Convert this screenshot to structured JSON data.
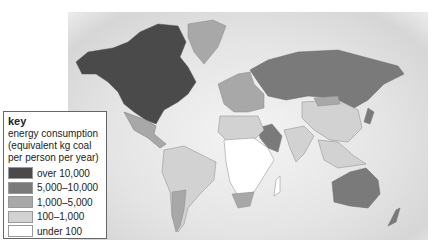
{
  "map": {
    "title": "World energy consumption map",
    "colors": {
      "ocean": "#e2e2e2",
      "over_10000": "#4a4a4a",
      "5000_10000": "#7a7a7a",
      "1000_5000": "#a8a8a8",
      "100_1000": "#d2d2d2",
      "under_100": "#ffffff"
    },
    "regions": [
      {
        "name": "North America (USA, Canada)",
        "class": "over 10,000"
      },
      {
        "name": "Greenland",
        "class": "1,000–5,000"
      },
      {
        "name": "Russia",
        "class": "5,000–10,000"
      },
      {
        "name": "Australia",
        "class": "5,000–10,000"
      },
      {
        "name": "South America",
        "class": "100–1,000"
      },
      {
        "name": "Argentina",
        "class": "1,000–5,000"
      },
      {
        "name": "Central Africa",
        "class": "under 100"
      },
      {
        "name": "China",
        "class": "100–1,000"
      },
      {
        "name": "Saudi Arabia",
        "class": "5,000–10,000"
      }
    ]
  },
  "key": {
    "title": "key",
    "description": "energy consumption (equivalent kg coal per person per year)",
    "items": [
      {
        "label": "over 10,000",
        "color": "#4a4a4a"
      },
      {
        "label": "5,000–10,000",
        "color": "#7a7a7a"
      },
      {
        "label": "1,000–5,000",
        "color": "#a8a8a8"
      },
      {
        "label": "100–1,000",
        "color": "#d2d2d2"
      },
      {
        "label": "under 100",
        "color": "#ffffff"
      }
    ]
  }
}
